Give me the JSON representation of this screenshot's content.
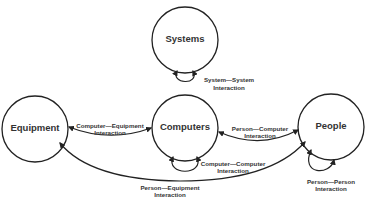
{
  "diagram": {
    "nodes": {
      "systems": {
        "label": "Systems"
      },
      "equipment": {
        "label": "Equipment"
      },
      "computers": {
        "label": "Computers"
      },
      "people": {
        "label": "People"
      }
    },
    "edges": {
      "system_system": {
        "from": "Systems",
        "to": "Systems",
        "label_line1": "System—System",
        "label_line2": "Interaction"
      },
      "computer_equipment": {
        "from": "Computers",
        "to": "Equipment",
        "label_line1": "Computer—Equipment",
        "label_line2": "Interaction"
      },
      "person_computer": {
        "from": "People",
        "to": "Computers",
        "label_line1": "Person—Computer",
        "label_line2": "Interaction"
      },
      "computer_computer": {
        "from": "Computers",
        "to": "Computers",
        "label_line1": "Computer—Computer",
        "label_line2": "Interaction"
      },
      "person_person": {
        "from": "People",
        "to": "People",
        "label_line1": "Person—Person",
        "label_line2": "Interaction"
      },
      "person_equipment": {
        "from": "People",
        "to": "Equipment",
        "label_line1": "Person—Equipment",
        "label_line2": "Interaction"
      }
    }
  }
}
